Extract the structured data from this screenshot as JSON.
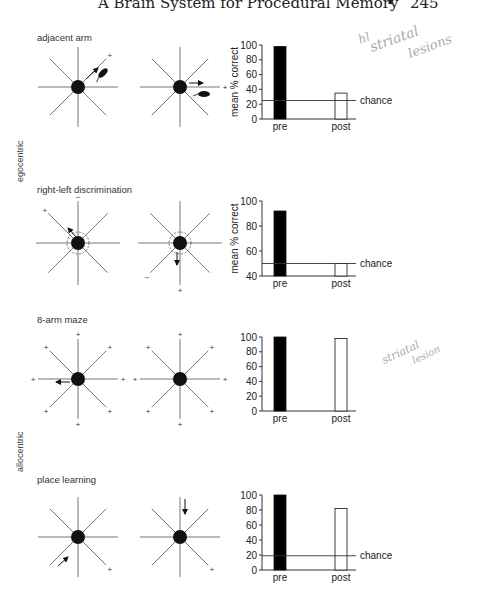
{
  "header": {
    "title": "A Brain System for Procedural Memory",
    "bullet": "•",
    "page_number": "245"
  },
  "side_labels": {
    "egocentric": "egocentric",
    "allocentric": "allocentric"
  },
  "panels": [
    {
      "label": "adjacent arm",
      "group": "egocentric"
    },
    {
      "label": "right-left discrimination",
      "group": "egocentric"
    },
    {
      "label": "8-arm maze",
      "group": "allocentric"
    },
    {
      "label": "place learning",
      "group": "allocentric"
    }
  ],
  "annotations": {
    "handwritten_1": "hl striatal lesions",
    "handwritten_2": "striatal lesion"
  },
  "chart_data": [
    {
      "type": "bar",
      "title": "adjacent arm",
      "categories": [
        "pre",
        "post"
      ],
      "values": [
        98,
        35
      ],
      "ylabel": "mean % correct",
      "xlabel": "",
      "ylim": [
        0,
        100
      ],
      "yticks": [
        0,
        20,
        40,
        60,
        80,
        100
      ],
      "chance": 25,
      "chance_label": "chance",
      "bar_colors": [
        "#000000",
        "#ffffff"
      ]
    },
    {
      "type": "bar",
      "title": "right-left discrimination",
      "categories": [
        "pre",
        "post"
      ],
      "values": [
        92,
        50
      ],
      "ylabel": "mean % correct",
      "xlabel": "",
      "ylim": [
        40,
        100
      ],
      "yticks": [
        40,
        60,
        80,
        100
      ],
      "chance": 50,
      "chance_label": "chance",
      "bar_colors": [
        "#000000",
        "#ffffff"
      ]
    },
    {
      "type": "bar",
      "title": "8-arm maze",
      "categories": [
        "pre",
        "post"
      ],
      "values": [
        100,
        98
      ],
      "ylabel": "",
      "xlabel": "",
      "ylim": [
        0,
        100
      ],
      "yticks": [
        0,
        20,
        40,
        60,
        80,
        100
      ],
      "chance": null,
      "bar_colors": [
        "#000000",
        "#ffffff"
      ]
    },
    {
      "type": "bar",
      "title": "place learning",
      "categories": [
        "pre",
        "post"
      ],
      "values": [
        100,
        82
      ],
      "ylabel": "",
      "xlabel": "",
      "ylim": [
        0,
        100
      ],
      "yticks": [
        0,
        20,
        40,
        60,
        80,
        100
      ],
      "chance": 19,
      "chance_label": "chance",
      "bar_colors": [
        "#000000",
        "#ffffff"
      ]
    }
  ],
  "chart_geometry": [
    {
      "axis_x": 262,
      "top_y": 45,
      "bottom_y": 119,
      "end_x": 356
    },
    {
      "axis_x": 262,
      "top_y": 201,
      "bottom_y": 276,
      "end_x": 356
    },
    {
      "axis_x": 262,
      "top_y": 337,
      "bottom_y": 411,
      "end_x": 356
    },
    {
      "axis_x": 262,
      "top_y": 495,
      "bottom_y": 570,
      "end_x": 356
    }
  ],
  "mazes": [
    {
      "cx": 78,
      "cy": 87,
      "r": 40,
      "plus": [
        "ne"
      ],
      "minus": [],
      "dashed": false,
      "arrows": [
        {
          "from": [
            86,
            79
          ],
          "to": [
            98,
            68
          ]
        }
      ],
      "rat": {
        "x": 103,
        "y": 73,
        "rot": -45
      }
    },
    {
      "cx": 180,
      "cy": 87,
      "r": 40,
      "plus": [
        "e"
      ],
      "minus": [],
      "dashed": false,
      "arrows": [
        {
          "from": [
            189,
            83
          ],
          "to": [
            203,
            83
          ]
        }
      ],
      "rat": {
        "x": 204,
        "y": 94,
        "rot": 0
      }
    },
    {
      "cx": 78,
      "cy": 243,
      "r": 42,
      "plus": [
        "nw"
      ],
      "minus": [
        "n"
      ],
      "dashed": true,
      "arrows": [
        {
          "from": [
            77,
            238
          ],
          "to": [
            68,
            228
          ]
        }
      ],
      "rat": null
    },
    {
      "cx": 180,
      "cy": 243,
      "r": 42,
      "plus": [
        "s"
      ],
      "minus": [
        "sw"
      ],
      "dashed": true,
      "arrows": [
        {
          "from": [
            177,
            252
          ],
          "to": [
            177,
            265
          ]
        }
      ],
      "rat": null
    },
    {
      "cx": 78,
      "cy": 379,
      "r": 40,
      "plus": [
        "n",
        "ne",
        "e",
        "se",
        "s",
        "sw",
        "w",
        "nw"
      ],
      "minus": [],
      "dashed": false,
      "arrows": [
        {
          "from": [
            70,
            382
          ],
          "to": [
            56,
            382
          ]
        }
      ],
      "rat": null
    },
    {
      "cx": 180,
      "cy": 379,
      "r": 40,
      "plus": [
        "n",
        "ne",
        "e",
        "se",
        "s",
        "sw",
        "w",
        "nw"
      ],
      "minus": [],
      "dashed": false,
      "arrows": [],
      "rat": null
    },
    {
      "cx": 78,
      "cy": 537,
      "r": 40,
      "plus": [
        "se"
      ],
      "minus": [],
      "dashed": false,
      "arrows": [
        {
          "from": [
            58,
            566
          ],
          "to": [
            68,
            557
          ]
        }
      ],
      "rat": null
    },
    {
      "cx": 180,
      "cy": 537,
      "r": 40,
      "plus": [
        "se"
      ],
      "minus": [],
      "dashed": false,
      "arrows": [
        {
          "from": [
            185,
            499
          ],
          "to": [
            185,
            514
          ]
        }
      ],
      "rat": null
    }
  ]
}
